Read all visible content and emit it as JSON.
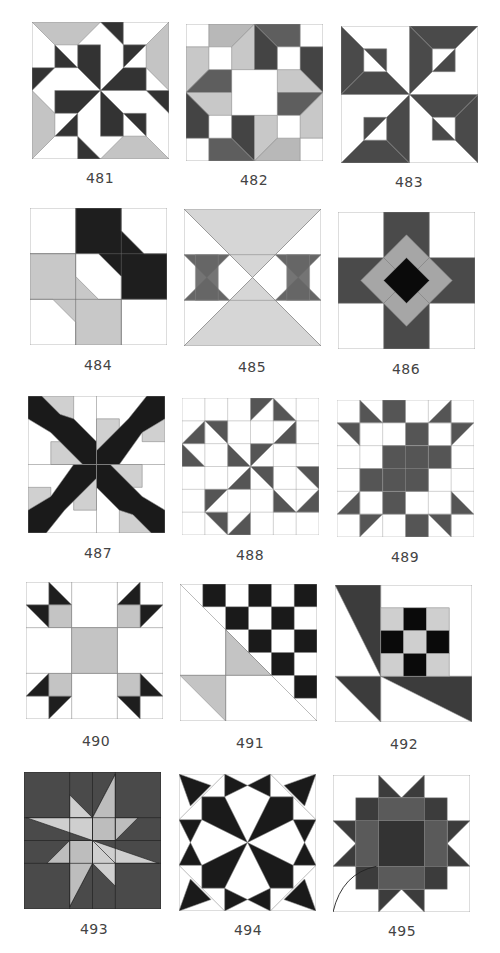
{
  "page": {
    "colors": {
      "white": "#ffffff",
      "light_gray": "#c8c8c8",
      "pale_gray": "#d6d6d6",
      "mid_gray": "#6e6e6e",
      "dark_gray": "#4a4a4a",
      "black": "#1a1a1a",
      "outline": "#888888"
    }
  },
  "blocks": [
    {
      "number": "481",
      "row": 1,
      "col": 1
    },
    {
      "number": "482",
      "row": 1,
      "col": 2
    },
    {
      "number": "483",
      "row": 1,
      "col": 3
    },
    {
      "number": "484",
      "row": 2,
      "col": 1
    },
    {
      "number": "485",
      "row": 2,
      "col": 2
    },
    {
      "number": "486",
      "row": 2,
      "col": 3
    },
    {
      "number": "487",
      "row": 3,
      "col": 1
    },
    {
      "number": "488",
      "row": 3,
      "col": 2
    },
    {
      "number": "489",
      "row": 3,
      "col": 3
    },
    {
      "number": "490",
      "row": 4,
      "col": 1
    },
    {
      "number": "491",
      "row": 4,
      "col": 2
    },
    {
      "number": "492",
      "row": 4,
      "col": 3
    },
    {
      "number": "493",
      "row": 5,
      "col": 1
    },
    {
      "number": "494",
      "row": 5,
      "col": 2
    },
    {
      "number": "495",
      "row": 5,
      "col": 3
    }
  ]
}
